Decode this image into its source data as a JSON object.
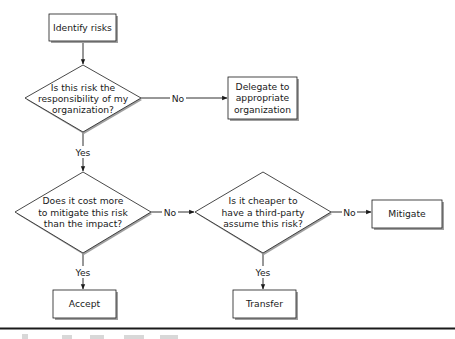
{
  "diagram": {
    "type": "flowchart",
    "nodes": [
      {
        "id": "identify",
        "shape": "process",
        "lines": [
          "Identify risks"
        ]
      },
      {
        "id": "responsibility",
        "shape": "decision",
        "lines": [
          "Is this risk the",
          "responsibility of my",
          "organization?"
        ]
      },
      {
        "id": "delegate",
        "shape": "process",
        "lines": [
          "Delegate to",
          "appropriate",
          "organization"
        ]
      },
      {
        "id": "cost",
        "shape": "decision",
        "lines": [
          "Does it cost more",
          "to mitigate this risk",
          "than the impact?"
        ]
      },
      {
        "id": "cheaper",
        "shape": "decision",
        "lines": [
          "Is it cheaper to",
          "have a third-party",
          "assume this risk?"
        ]
      },
      {
        "id": "mitigate",
        "shape": "process",
        "lines": [
          "Mitigate"
        ]
      },
      {
        "id": "accept",
        "shape": "process",
        "lines": [
          "Accept"
        ]
      },
      {
        "id": "transfer",
        "shape": "process",
        "lines": [
          "Transfer"
        ]
      }
    ],
    "edges": [
      {
        "from": "identify",
        "to": "responsibility",
        "label": ""
      },
      {
        "from": "responsibility",
        "to": "delegate",
        "label": "No"
      },
      {
        "from": "responsibility",
        "to": "cost",
        "label": "Yes"
      },
      {
        "from": "cost",
        "to": "cheaper",
        "label": "No"
      },
      {
        "from": "cost",
        "to": "accept",
        "label": "Yes"
      },
      {
        "from": "cheaper",
        "to": "mitigate",
        "label": "No"
      },
      {
        "from": "cheaper",
        "to": "transfer",
        "label": "Yes"
      }
    ],
    "colors": {
      "stroke": "#1a1a1a",
      "shadow": "#9a9a9a",
      "fill": "#ffffff"
    }
  },
  "labels": {
    "identify_0": "Identify risks",
    "resp_0": "Is this risk the",
    "resp_1": "responsibility of my",
    "resp_2": "organization?",
    "delegate_0": "Delegate to",
    "delegate_1": "appropriate",
    "delegate_2": "organization",
    "cost_0": "Does it cost more",
    "cost_1": "to mitigate this risk",
    "cost_2": "than the impact?",
    "cheaper_0": "Is it cheaper to",
    "cheaper_1": "have a third-party",
    "cheaper_2": "assume this risk?",
    "mitigate_0": "Mitigate",
    "accept_0": "Accept",
    "transfer_0": "Transfer",
    "edge_no": "No",
    "edge_yes": "Yes"
  }
}
